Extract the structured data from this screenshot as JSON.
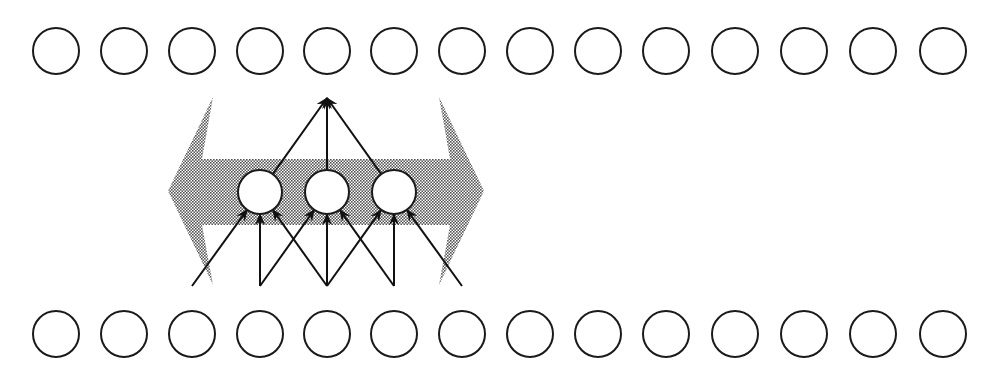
{
  "diagram": {
    "type": "convolutional-network-schematic",
    "colors": {
      "unit_stroke": "#1a1a1a",
      "unit_fill": "#ffffff",
      "edge": "#111111",
      "shading": "#9a9a9a"
    },
    "layers": {
      "output": {
        "y": 51,
        "r": 23,
        "xs": [
          56,
          124,
          192,
          260,
          327,
          394,
          462,
          530,
          598,
          666,
          735,
          804,
          873,
          943
        ]
      },
      "hidden": {
        "y": 192,
        "r": 22,
        "xs": [
          260,
          327,
          394
        ]
      },
      "input": {
        "y": 334,
        "r": 23,
        "xs": [
          56,
          124,
          192,
          260,
          327,
          394,
          462,
          530,
          598,
          666,
          735,
          804,
          873,
          943
        ]
      }
    },
    "input_connections": [
      {
        "hidden": 0,
        "from_x": [
          192,
          260,
          327
        ]
      },
      {
        "hidden": 1,
        "from_x": [
          260,
          327,
          394
        ]
      },
      {
        "hidden": 2,
        "from_x": [
          327,
          394,
          462
        ]
      }
    ],
    "output_connections": {
      "target_x": 327,
      "target_y": 98,
      "from_hidden": [
        0,
        1,
        2
      ]
    },
    "source_y": 286,
    "shift_arrow": {
      "description": "double-headed shaded arrow indicating weight-shared kernel sliding horizontally",
      "left_tip": [
        168,
        191
      ],
      "right_tip": [
        484,
        191
      ],
      "shaft_top": 159,
      "shaft_bottom": 225,
      "head_top": 97,
      "head_bottom": 285,
      "left_head_base_x": 213,
      "right_head_base_x": 439
    }
  }
}
